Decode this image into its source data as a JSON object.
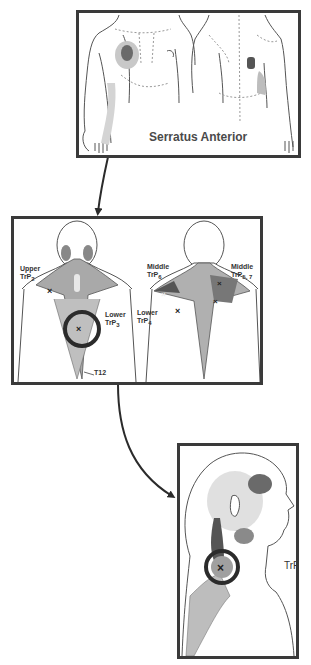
{
  "panels": {
    "serratus": {
      "caption": "Serratus Anterior"
    },
    "trapezius": {
      "labels": {
        "upper_word": "Upper",
        "upper_trp": "TrP",
        "upper_sub": "2",
        "lower3_word": "Lower",
        "lower3_trp": "TrP",
        "lower3_sub": "3",
        "t12": "T12",
        "middle6_word": "Middle",
        "middle6_trp": "TrP",
        "middle6_sub": "6",
        "lower4_word": "Lower",
        "lower4_trp": "TrP",
        "lower4_sub": "4",
        "middle57_word": "Middle",
        "middle57_trp": "TrP",
        "middle57_sub": "5, 7"
      }
    },
    "neck": {
      "label": "TrP",
      "label_sub": "1"
    }
  },
  "colors": {
    "frame": "#3a3a3a",
    "line": "#444444",
    "shade": "#9a9a9a",
    "dark_shade": "#555555",
    "circle": "#2b2b2b"
  }
}
